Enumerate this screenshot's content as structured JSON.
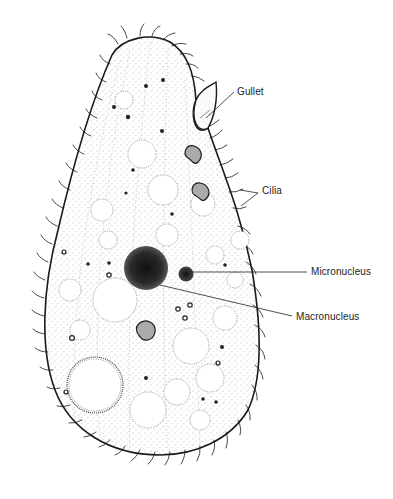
{
  "diagram": {
    "labels": [
      {
        "id": "gullet",
        "text": "Gullet",
        "x": 237,
        "y": 86
      },
      {
        "id": "cilia",
        "text": "Cilia",
        "x": 262,
        "y": 185
      },
      {
        "id": "micronucleus",
        "text": "Micronucleus",
        "x": 311,
        "y": 266
      },
      {
        "id": "macronucleus",
        "text": "Macronucleus",
        "x": 296,
        "y": 311
      }
    ],
    "colors": {
      "ink": "#1a1a1a",
      "background": "#ffffff",
      "stipple": "#555555"
    }
  }
}
